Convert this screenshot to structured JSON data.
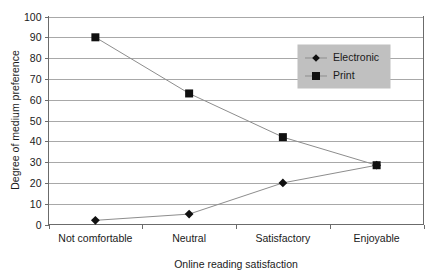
{
  "chart_data": {
    "type": "line",
    "title": "",
    "xlabel": "Online reading satisfaction",
    "ylabel": "Degree of medium preference",
    "categories": [
      "Not comfortable",
      "Neutral",
      "Satisfactory",
      "Enjoyable"
    ],
    "series": [
      {
        "name": "Electronic",
        "marker": "diamond",
        "values": [
          2,
          5,
          20,
          28.5
        ]
      },
      {
        "name": "Print",
        "marker": "square",
        "values": [
          90,
          63,
          42,
          28.5
        ]
      }
    ],
    "ylim": [
      0,
      100
    ],
    "ytick_step": 10,
    "yticks": [
      "0",
      "10",
      "20",
      "30",
      "40",
      "50",
      "60",
      "70",
      "80",
      "90",
      "100"
    ],
    "grid": "horizontal",
    "legend_position": "inside-top-right",
    "colors": {
      "gridline": "#a8a8a8",
      "axis": "#6b6b6b",
      "series_line": "#8d8d8d",
      "marker": "#101010",
      "legend_background": "#c0c0c0",
      "background": "#ffffff",
      "text": "#1a1a1a"
    }
  },
  "legend": {
    "items": [
      {
        "label": "Electronic",
        "marker": "diamond"
      },
      {
        "label": "Print",
        "marker": "square"
      }
    ]
  }
}
